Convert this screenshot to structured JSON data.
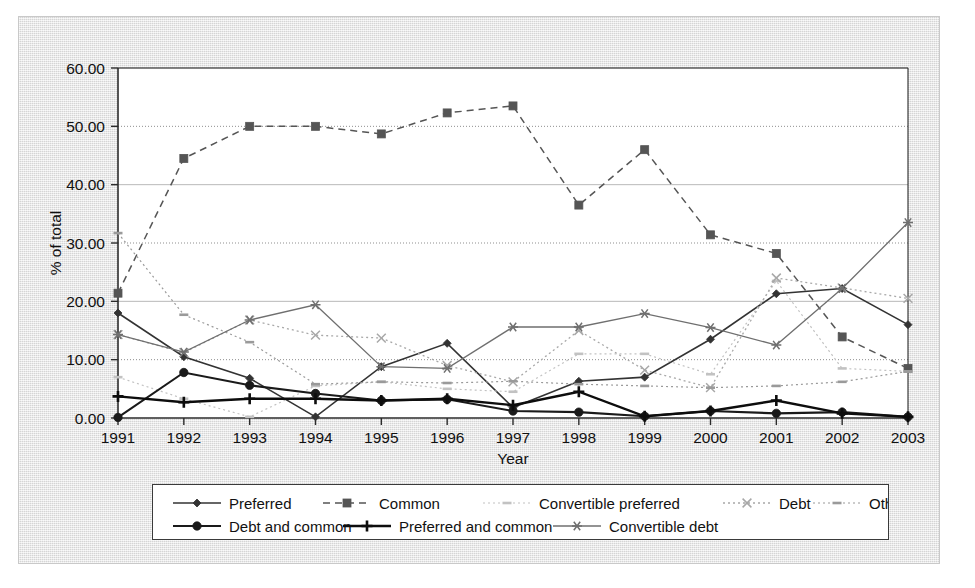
{
  "chart_data": {
    "type": "line",
    "title": "",
    "xlabel": "Year",
    "ylabel": "% of total",
    "x": [
      1991,
      1992,
      1993,
      1994,
      1995,
      1996,
      1997,
      1998,
      1999,
      2000,
      2001,
      2002,
      2003
    ],
    "categories": [
      "1991",
      "1992",
      "1993",
      "1994",
      "1995",
      "1996",
      "1997",
      "1998",
      "1999",
      "2000",
      "2001",
      "2002",
      "2003"
    ],
    "ylim": [
      0,
      60
    ],
    "yticks": [
      0,
      10,
      20,
      30,
      40,
      50,
      60
    ],
    "ytick_labels": [
      "0.00",
      "10.00",
      "20.00",
      "30.00",
      "40.00",
      "50.00",
      "60.00"
    ],
    "grid": true,
    "legend_position": "bottom",
    "series": [
      {
        "name": "Preferred",
        "marker": "diamond",
        "dash": "solid",
        "color": "#333333",
        "width": 1.6,
        "values": [
          18.0,
          10.5,
          6.8,
          0.2,
          8.8,
          12.8,
          1.8,
          6.3,
          7.0,
          13.5,
          21.3,
          22.2,
          16.0
        ]
      },
      {
        "name": "Common",
        "marker": "square",
        "dash": "dashed",
        "color": "#555555",
        "width": 1.5,
        "values": [
          21.4,
          44.5,
          50.0,
          50.0,
          48.7,
          52.3,
          53.5,
          36.5,
          46.0,
          31.4,
          28.2,
          13.9,
          8.5
        ]
      },
      {
        "name": "Convertible preferred",
        "marker": "star",
        "dash": "dotted",
        "color": "#c2c2c2",
        "width": 1.2,
        "values": [
          7.0,
          3.3,
          0.2,
          5.5,
          6.2,
          5.0,
          4.5,
          11.0,
          11.0,
          7.5,
          23.5,
          8.5,
          8.0
        ]
      },
      {
        "name": "Debt",
        "marker": "cross",
        "dash": "dotted",
        "color": "#a8a8a8",
        "width": 1.3,
        "values": [
          14.3,
          11.2,
          16.8,
          14.2,
          13.7,
          9.0,
          6.2,
          15.0,
          8.2,
          5.2,
          24.0,
          22.3,
          20.5
        ]
      },
      {
        "name": "Other",
        "marker": "dash",
        "dash": "dotted",
        "color": "#9a9a9a",
        "width": 1.2,
        "values": [
          31.7,
          17.7,
          13.0,
          5.8,
          6.2,
          6.0,
          6.3,
          5.8,
          5.5,
          5.2,
          5.5,
          6.2,
          8.0
        ]
      },
      {
        "name": "Debt and common",
        "marker": "circle",
        "dash": "solid",
        "color": "#1a1a1a",
        "width": 2.1,
        "values": [
          0.1,
          7.8,
          5.6,
          4.2,
          3.0,
          3.2,
          1.2,
          1.0,
          0.3,
          1.2,
          0.8,
          1.0,
          0.2
        ]
      },
      {
        "name": "Preferred and common",
        "marker": "plus",
        "dash": "solid",
        "color": "#0d0d0d",
        "width": 2.4,
        "values": [
          3.7,
          2.7,
          3.3,
          3.3,
          3.0,
          3.3,
          2.2,
          4.5,
          0.3,
          1.2,
          3.0,
          0.8,
          0.2
        ]
      },
      {
        "name": "Convertible debt",
        "marker": "asterisk",
        "dash": "solid",
        "color": "#6f6f6f",
        "width": 1.3,
        "values": [
          14.3,
          11.3,
          16.8,
          19.4,
          8.8,
          8.5,
          15.6,
          15.6,
          17.9,
          15.5,
          12.5,
          22.2,
          33.5
        ]
      }
    ]
  },
  "axes": {
    "y_title": "% of total",
    "x_title": "Year"
  },
  "legend": {
    "rows": [
      [
        "Preferred",
        "Common",
        "Convertible preferred",
        "Debt",
        "Other"
      ],
      [
        "Debt and common",
        "Preferred and common",
        "Convertible debt"
      ]
    ]
  }
}
